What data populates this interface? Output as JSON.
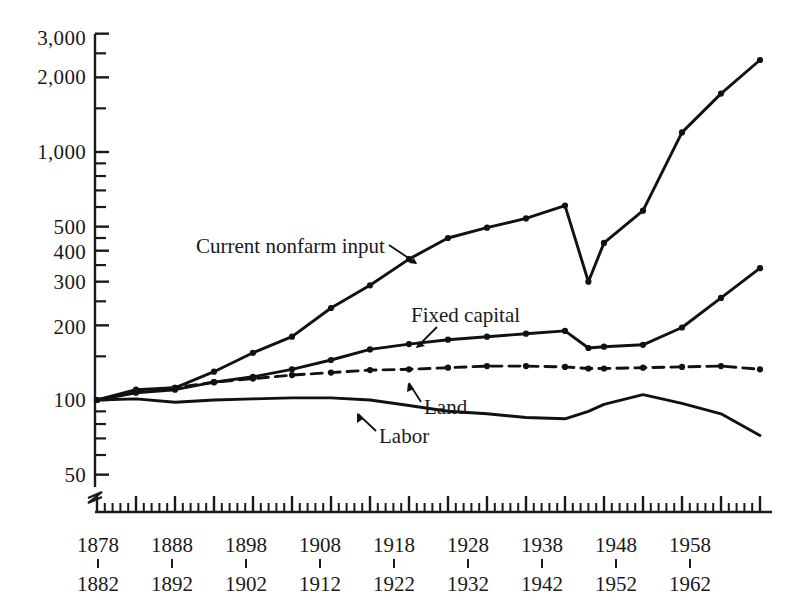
{
  "chart_data": {
    "type": "line",
    "title": "",
    "subtitle": "",
    "xlabel": "",
    "ylabel": "",
    "yscale": "log",
    "ylim": [
      45,
      3200
    ],
    "xlim": [
      1878,
      1966
    ],
    "grid": false,
    "legend_position": "inline-annotations",
    "y_ticks_major": [
      "50",
      "100",
      "200",
      "300",
      "400",
      "500",
      "1,000",
      "2,000",
      "3,000"
    ],
    "y_tick_values": [
      50,
      100,
      200,
      300,
      400,
      500,
      1000,
      2000,
      3000
    ],
    "y_ticks_minor": [
      60,
      70,
      80,
      90,
      150,
      250,
      350,
      450,
      600,
      700,
      800,
      900,
      1500,
      2500
    ],
    "axis_break": true,
    "x_tick_labels_upper": [
      "1878",
      "1888",
      "1898",
      "1908",
      "1918",
      "1928",
      "1938",
      "1948",
      "1958"
    ],
    "x_tick_labels_lower": [
      "1882",
      "1892",
      "1902",
      "1912",
      "1922",
      "1932",
      "1942",
      "1952",
      "1962"
    ],
    "x_tick_anchor_years": [
      1880,
      1890,
      1900,
      1910,
      1920,
      1930,
      1940,
      1950,
      1960
    ],
    "x_minor_tick_interval_years": 1,
    "x_major_tick_interval_years": 5,
    "x": [
      1880,
      1885,
      1890,
      1895,
      1900,
      1905,
      1910,
      1915,
      1920,
      1925,
      1930,
      1935,
      1940,
      1943,
      1945,
      1950,
      1955,
      1960,
      1965
    ],
    "series": [
      {
        "name": "Current nonfarm input",
        "style": "solid",
        "markers": true,
        "values": [
          100,
          110,
          112,
          130,
          155,
          180,
          235,
          290,
          370,
          450,
          495,
          540,
          608,
          300,
          430,
          580,
          1200,
          1720,
          2350
        ]
      },
      {
        "name": "Fixed capital",
        "style": "solid",
        "markers": true,
        "values": [
          100,
          107,
          110,
          118,
          124,
          133,
          145,
          160,
          168,
          175,
          180,
          185,
          190,
          162,
          164,
          167,
          196,
          258,
          340
        ]
      },
      {
        "name": "Land",
        "style": "dashed",
        "markers": true,
        "values": [
          100,
          108,
          112,
          118,
          122,
          126,
          129,
          132,
          133,
          135,
          137,
          137,
          136,
          134,
          134,
          135,
          136,
          137,
          133
        ]
      },
      {
        "name": "Labor",
        "style": "solid",
        "markers": false,
        "values": [
          100,
          101,
          98,
          100,
          101,
          102,
          102,
          100,
          95,
          90,
          88,
          85,
          84,
          90,
          96,
          105,
          97,
          88,
          72
        ]
      }
    ],
    "annotations": [
      {
        "text": "Current nonfarm input",
        "target_series": "Current nonfarm input",
        "arrow": true
      },
      {
        "text": "Fixed capital",
        "target_series": "Fixed capital",
        "arrow": true
      },
      {
        "text": "Land",
        "target_series": "Land",
        "arrow": true
      },
      {
        "text": "Labor",
        "target_series": "Labor",
        "arrow": true
      }
    ],
    "colors": {
      "line": "#111111",
      "axis": "#1a1a1a",
      "background": "#ffffff"
    }
  }
}
